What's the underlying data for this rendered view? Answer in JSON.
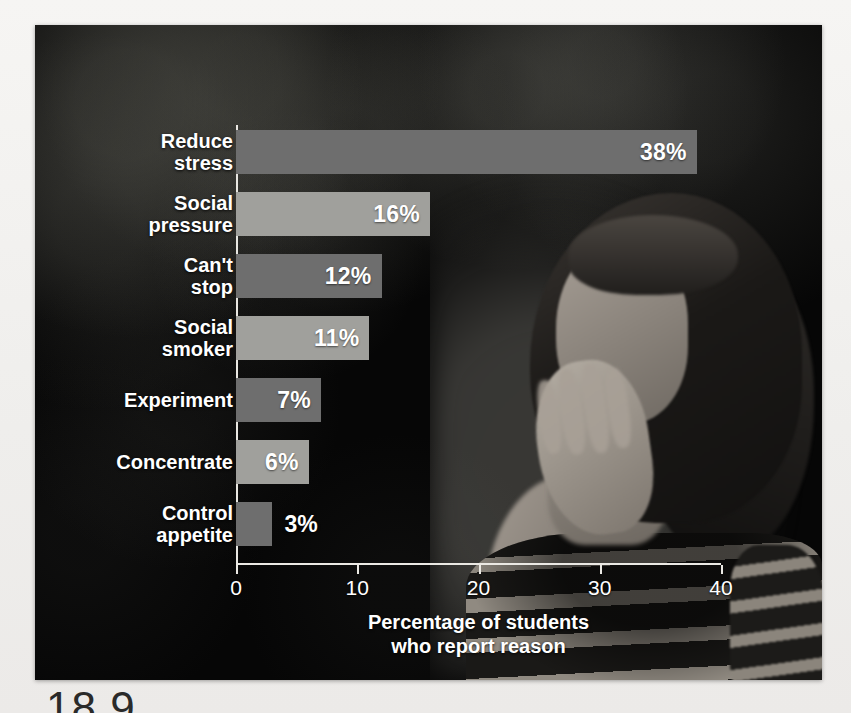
{
  "figure": {
    "number_partial": "18.9"
  },
  "chart_data": {
    "type": "bar",
    "orientation": "horizontal",
    "title": "",
    "categories": [
      "Reduce\nstress",
      "Social\npressure",
      "Can't\nstop",
      "Social\nsmoker",
      "Experiment",
      "Concentrate",
      "Control\nappetite"
    ],
    "values": [
      38,
      16,
      12,
      11,
      7,
      6,
      3
    ],
    "value_labels": [
      "38%",
      "16%",
      "12%",
      "11%",
      "7%",
      "6%",
      "3%"
    ],
    "bar_colors": [
      "#6e6e6e",
      "#a0a09c",
      "#6e6e6e",
      "#a0a09c",
      "#6e6e6e",
      "#a0a09c",
      "#6e6e6e"
    ],
    "xlabel": "Percentage of students\nwho report reason",
    "ylabel": "",
    "xlim": [
      0,
      40
    ],
    "xticks": [
      0,
      10,
      20,
      30,
      40
    ],
    "xtick_labels": [
      "0",
      "10",
      "20",
      "30",
      "40"
    ],
    "grid": false,
    "legend": null
  },
  "photo": {
    "alt_description": "young woman with dark bangs resting hand on her face, wearing horizontally striped shirt, dark blurred foliage background"
  }
}
